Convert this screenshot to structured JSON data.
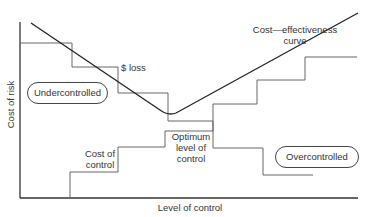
{
  "diagram": {
    "axes": {
      "x_label": "Level of control",
      "y_label": "Cost of risk"
    },
    "curves": {
      "cost_effectiveness": {
        "label_line1": "Cost—effectiveness",
        "label_line2": "curve",
        "color": "#2a2a2a"
      },
      "loss": {
        "label": "$ loss",
        "color": "#555555"
      },
      "cost_of_control": {
        "label_line1": "Cost of",
        "label_line2": "control",
        "color": "#555555"
      }
    },
    "annotations": {
      "optimum_line1": "Optimum",
      "optimum_line2": "level of",
      "optimum_line3": "control"
    },
    "regions": {
      "under": "Undercontrolled",
      "over": "Overcontrolled"
    }
  }
}
